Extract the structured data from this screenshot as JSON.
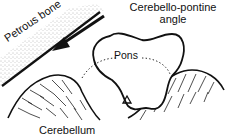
{
  "diagram": {
    "labels": {
      "petrous_bone": "Petrous bone",
      "cpa_line1": "Cerebello-pontine",
      "cpa_line2": "angle",
      "pons": "Pons",
      "cerebellum": "Cerebellum"
    },
    "markers": {
      "fourth_ventricle_symbol": "Δ"
    },
    "colors": {
      "ink": "#111111",
      "background": "#ffffff",
      "stipple": "#555555"
    }
  }
}
